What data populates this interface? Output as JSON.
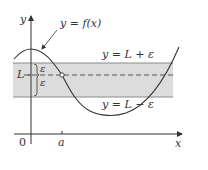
{
  "diagram": {
    "axes": {
      "y_label": "y",
      "x_label": "x",
      "origin_label": "0",
      "a_label": "a"
    },
    "labels": {
      "function": "y = f(x)",
      "upper_bound": "y = L + ε",
      "lower_bound": "y = L − ε",
      "limit": "L",
      "epsilon_upper": "ε",
      "epsilon_lower": "ε"
    },
    "colors": {
      "band_fill": "#dcdcdc",
      "band_edge": "#8a8a8a",
      "curve": "#333333",
      "axis": "#333333",
      "dash": "#555555"
    },
    "geometry": {
      "axis_x_y": 134,
      "axis_y_x": 31,
      "band_top_y": 63,
      "band_bottom_y": 97,
      "limit_line_y": 75,
      "a_x": 62
    }
  }
}
